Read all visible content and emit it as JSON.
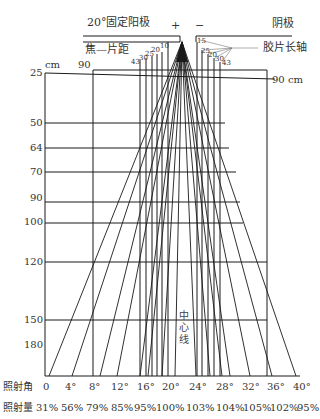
{
  "header": {
    "anode_label": "20°固定阳极",
    "plus_sign": "+",
    "minus_sign": "−",
    "cathode_label": "阴极",
    "focus_film_distance_label": "焦—片距",
    "film_long_axis_label": "胶片长轴"
  },
  "top_small_labels": {
    "left": [
      "43",
      "30",
      "25",
      "20",
      "10"
    ],
    "right": [
      "15",
      "25",
      "20",
      "30",
      "43"
    ]
  },
  "units": {
    "cm_label": "cm",
    "distance_90_label": "90",
    "distance_90cm_label": "90 cm"
  },
  "distance_rows": [
    {
      "label": "25"
    },
    {
      "label": "50"
    },
    {
      "label": "64"
    },
    {
      "label": "70"
    },
    {
      "label": "90"
    },
    {
      "label": "100"
    },
    {
      "label": "120"
    },
    {
      "label": "150"
    },
    {
      "label": "180"
    }
  ],
  "center_line_label": [
    "中",
    "心",
    "线"
  ],
  "angle_row": {
    "label": "照射角",
    "values": [
      "0",
      "4°",
      "8°",
      "12°",
      "16°",
      "20°",
      "24°",
      "28°",
      "32°",
      "36°",
      "40°"
    ]
  },
  "intensity_row": {
    "label": "照射量",
    "values": [
      "31%",
      "56%",
      "79%",
      "85%",
      "95%",
      "100%",
      "103%",
      "104%",
      "105%",
      "102%",
      "95%"
    ]
  }
}
